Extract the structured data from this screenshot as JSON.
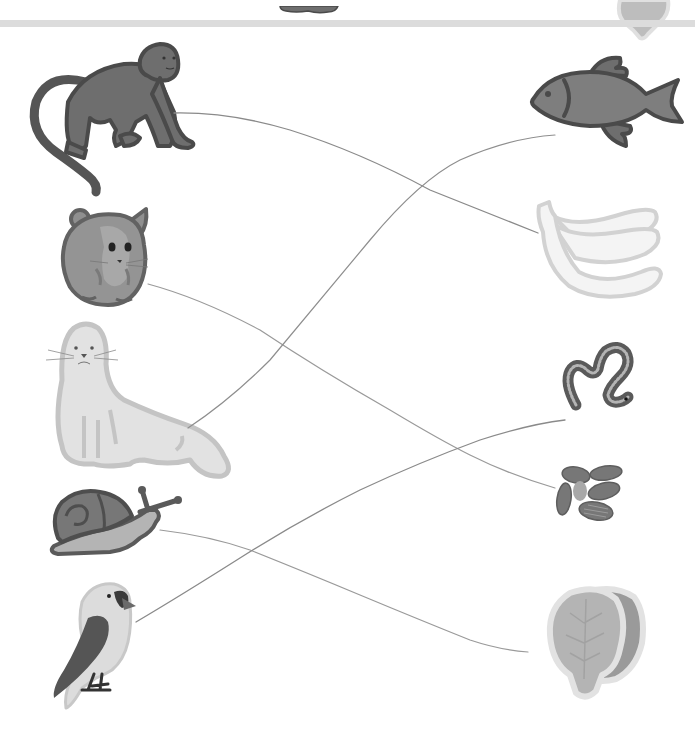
{
  "worksheet": {
    "type": "matching",
    "colors": {
      "background": "#ffffff",
      "divider": "#dcdcdc",
      "pencil_line": "#8a8a8a",
      "dark_fill": "#6e6e6e",
      "dark_outline": "#4a4a4a",
      "mid_fill": "#9a9a9a",
      "light_fill": "#e2e2e2",
      "light_outline": "#c4c4c4"
    },
    "top_fragments": [
      {
        "id": "prev-animal-fragment",
        "icon": "cropped-animal-icon"
      },
      {
        "id": "prev-food-fragment",
        "icon": "cropped-lettuce-icon"
      }
    ],
    "animals": [
      {
        "id": "monkey",
        "icon": "monkey-icon"
      },
      {
        "id": "hamster",
        "icon": "hamster-icon"
      },
      {
        "id": "seal",
        "icon": "seal-icon"
      },
      {
        "id": "snail",
        "icon": "snail-icon"
      },
      {
        "id": "bird",
        "icon": "bird-icon"
      }
    ],
    "foods": [
      {
        "id": "fish",
        "icon": "fish-icon"
      },
      {
        "id": "banana",
        "icon": "banana-icon"
      },
      {
        "id": "worm",
        "icon": "worm-icon"
      },
      {
        "id": "seeds",
        "icon": "seeds-icon"
      },
      {
        "id": "lettuce",
        "icon": "lettuce-icon"
      }
    ],
    "connections": [
      {
        "from": "monkey",
        "to": "banana"
      },
      {
        "from": "hamster",
        "to": "seeds"
      },
      {
        "from": "seal",
        "to": "fish"
      },
      {
        "from": "snail",
        "to": "lettuce"
      },
      {
        "from": "bird",
        "to": "worm"
      }
    ]
  }
}
